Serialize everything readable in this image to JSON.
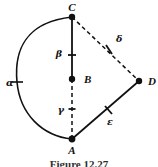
{
  "figure": {
    "caption": "Figure 12.27",
    "background_color": "#ffffff",
    "ink_color": "#111111",
    "vertices": [
      {
        "id": "C",
        "label": "C",
        "x": 72,
        "y": 17,
        "label_x": 72,
        "label_y": 10
      },
      {
        "id": "B",
        "label": "B",
        "x": 72,
        "y": 79,
        "label_x": 84,
        "label_y": 83
      },
      {
        "id": "A",
        "label": "A",
        "x": 72,
        "y": 139,
        "label_x": 72,
        "label_y": 153
      },
      {
        "id": "D",
        "label": "D",
        "x": 139,
        "y": 81,
        "label_x": 150,
        "label_y": 85
      }
    ],
    "edges": [
      {
        "id": "alpha",
        "label": "α",
        "from": "C",
        "to": "A",
        "style": "solid",
        "shape": "arc",
        "label_x": 9,
        "label_y": 84,
        "tick": true
      },
      {
        "id": "beta",
        "label": "β",
        "from": "C",
        "to": "B",
        "style": "solid",
        "shape": "line",
        "label_x": 63,
        "label_y": 54,
        "tick": true
      },
      {
        "id": "gamma",
        "label": "γ",
        "from": "B",
        "to": "A",
        "style": "dashed",
        "shape": "line",
        "label_x": 62,
        "label_y": 110,
        "tick": true
      },
      {
        "id": "delta",
        "label": "δ",
        "from": "C",
        "to": "D",
        "style": "dashed",
        "shape": "line",
        "label_x": 118,
        "label_y": 41,
        "tick": true
      },
      {
        "id": "epsilon",
        "label": "ε",
        "from": "A",
        "to": "D",
        "style": "solid",
        "shape": "line",
        "label_x": 113,
        "label_y": 122,
        "tick": true
      }
    ]
  }
}
